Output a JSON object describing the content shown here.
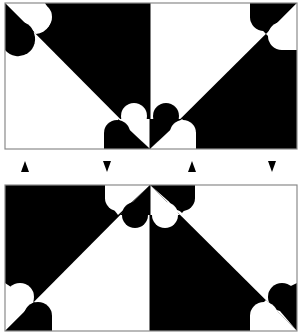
{
  "diagram": {
    "colors": {
      "fill_dark": "#000000",
      "fill_light": "#ffffff",
      "frame": "#8a8a8a"
    },
    "panels": [
      {
        "id": "top-panel",
        "x": 5,
        "y": 3,
        "width": 292,
        "height": 146
      },
      {
        "id": "bottom-panel",
        "x": 5,
        "y": 185,
        "width": 292,
        "height": 146
      }
    ],
    "arrows": [
      {
        "direction": "up",
        "x": 25,
        "y": 167
      },
      {
        "direction": "down",
        "x": 107,
        "y": 167
      },
      {
        "direction": "up",
        "x": 192,
        "y": 167
      },
      {
        "direction": "down",
        "x": 272,
        "y": 167
      }
    ]
  }
}
